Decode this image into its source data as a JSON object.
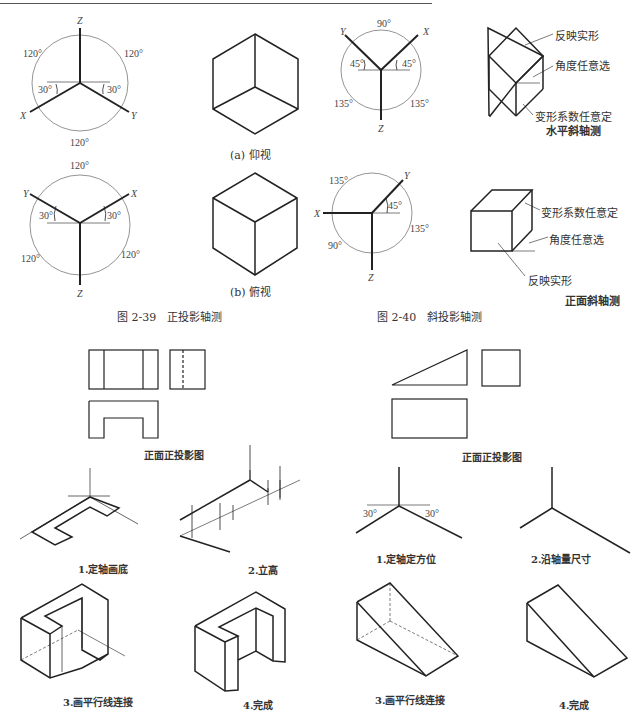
{
  "fig39": {
    "caption": "图 2-39　正投影轴测",
    "sub_a": "(a) 仰视",
    "sub_b": "(b) 俯视",
    "upper_axes": {
      "z": "Z",
      "x": "X",
      "y": "Y",
      "a1": "120°",
      "a2": "120°",
      "a3": "120°",
      "left": "30°",
      "right": "30°"
    },
    "lower_axes": {
      "z": "Z",
      "x": "X",
      "y": "Y",
      "a1": "120°",
      "a2": "120°",
      "a3": "120°",
      "left": "30°",
      "right": "30°"
    }
  },
  "fig40": {
    "caption": "图 2-40　斜投影轴测",
    "upper_axes": {
      "z": "Z",
      "x": "X",
      "y": "Y",
      "top": "90°",
      "left": "45°",
      "right": "45°",
      "bl": "135°",
      "br": "135°"
    },
    "upper_notes": {
      "n1": "反映实形",
      "n2": "角度任意选",
      "n3": "变形系数任意定",
      "n4": "水平斜轴测"
    },
    "lower_axes": {
      "z": "Z",
      "x": "X",
      "y": "Y",
      "tl": "135°",
      "ang": "45°",
      "r": "135°",
      "bl": "90°"
    },
    "lower_notes": {
      "n1": "变形系数任意定",
      "n2": "角度任意选",
      "n3": "反映实形",
      "n4": "正面斜轴测"
    }
  },
  "left_example": {
    "proj_caption": "正面正投影图",
    "steps": [
      "1.定轴画底",
      "2.立高",
      "3.画平行线连接",
      "4.完成"
    ]
  },
  "right_example": {
    "proj_caption": "正面正投影图",
    "steps": [
      "1.定轴定方位",
      "2.沿轴量尺寸",
      "3.画平行线连接",
      "4.完成"
    ],
    "angle_left": "30°",
    "angle_right": "30°"
  }
}
